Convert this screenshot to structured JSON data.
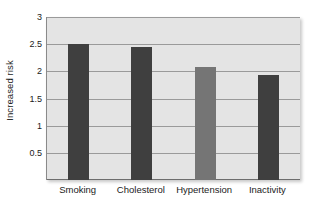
{
  "chart_data": {
    "type": "bar",
    "title": "",
    "xlabel": "",
    "ylabel": "Increased risk",
    "categories": [
      "Smoking",
      "Cholesterol",
      "Hypertension",
      "Inactivity"
    ],
    "values": [
      2.5,
      2.44,
      2.08,
      1.94
    ],
    "bar_colors": [
      "#3f3f3f",
      "#3f3f3f",
      "#757575",
      "#3f3f3f"
    ],
    "ylim": [
      0,
      3
    ],
    "yticks": [
      0.5,
      1,
      1.5,
      2,
      2.5,
      3
    ],
    "ytick_labels": [
      "0.5",
      "1",
      "1.5",
      "2",
      "2.5",
      "3"
    ],
    "gridlines": true,
    "legend": null,
    "plot_background": "#e4e4e4",
    "gridline_color": "#9a9a9a",
    "text_color": "#1b1b1b"
  }
}
